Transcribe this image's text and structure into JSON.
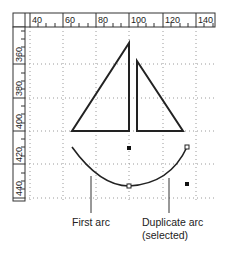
{
  "rulers": {
    "horizontal": {
      "labels": [
        "40",
        "60",
        "80",
        "100",
        "120",
        "140"
      ],
      "label_x": [
        30,
        63,
        96,
        129,
        163,
        196
      ]
    },
    "vertical": {
      "labels": [
        "360",
        "380",
        "400",
        "420",
        "440"
      ],
      "label_y": [
        50,
        84,
        117,
        150,
        183
      ]
    }
  },
  "shapes": {
    "left_triangle": {
      "points": "129,43 72,131 129,131"
    },
    "right_triangle": {
      "points": "137,61 137,131 183,131"
    },
    "first_arc": {
      "path": "M72,147 Q100,186 129,186"
    },
    "duplicate_arc": {
      "path": "M129,186 Q170,184 187,147"
    }
  },
  "selection": {
    "endpoints": [
      [
        129,
        186
      ],
      [
        187,
        147
      ]
    ],
    "handles": [
      [
        129,
        148
      ],
      [
        187,
        184
      ]
    ]
  },
  "callouts": {
    "first_arc": {
      "label": "First arc"
    },
    "duplicate_arc": {
      "label_line1": "Duplicate arc",
      "label_line2": "(selected)"
    }
  },
  "colors": {
    "stroke": "#222222",
    "grid": "#888888",
    "ruler_border": "#333333"
  }
}
